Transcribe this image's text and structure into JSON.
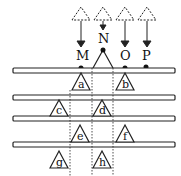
{
  "labels": {
    "M": "M",
    "N": "N",
    "O": "O",
    "P": "P"
  },
  "triangles": {
    "a": "a",
    "b": "b",
    "c": "c",
    "d": "d",
    "e": "e",
    "f": "f",
    "g": "g",
    "h": "h"
  }
}
